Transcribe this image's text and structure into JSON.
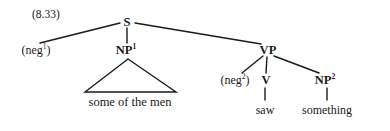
{
  "figure": {
    "example_number": "(8.33)",
    "type": "phrase-structure-tree",
    "ink_color": "#1a1a1a",
    "background_color": "#ffffff"
  },
  "nodes": {
    "s": {
      "label": "S",
      "x": 127,
      "y": 22
    },
    "neg1": {
      "label": "(neg",
      "sup": "1",
      "close": ")",
      "x": 36,
      "y": 50
    },
    "np1": {
      "label": "NP",
      "sup": "1",
      "x": 126,
      "y": 50
    },
    "vp": {
      "label": "VP",
      "x": 268,
      "y": 50
    },
    "neg2": {
      "label": "(neg",
      "sup": "2",
      "close": ")",
      "x": 235,
      "y": 80
    },
    "v": {
      "label": "V",
      "x": 266,
      "y": 80
    },
    "np2": {
      "label": "NP",
      "sup": "2",
      "x": 325,
      "y": 80
    }
  },
  "terminals": {
    "phrase_np1": {
      "text": "some of the men",
      "x": 130,
      "y": 102
    },
    "saw": {
      "text": "saw",
      "x": 265,
      "y": 110
    },
    "something": {
      "text": "something",
      "x": 327,
      "y": 110
    }
  },
  "edges": [
    {
      "name": "s-to-neg1",
      "from": "S",
      "to": "(neg1)",
      "x1": 120,
      "y1": 23,
      "x2": 40,
      "y2": 43
    },
    {
      "name": "s-to-np1",
      "from": "S",
      "to": "NP1",
      "x1": 127,
      "y1": 28,
      "x2": 127,
      "y2": 43
    },
    {
      "name": "s-to-vp",
      "from": "S",
      "to": "VP",
      "x1": 135,
      "y1": 23,
      "x2": 261,
      "y2": 44
    },
    {
      "name": "vp-to-neg2",
      "from": "VP",
      "to": "(neg2)",
      "x1": 263,
      "y1": 56,
      "x2": 242,
      "y2": 73
    },
    {
      "name": "vp-to-v",
      "from": "VP",
      "to": "V",
      "x1": 267,
      "y1": 57,
      "x2": 266,
      "y2": 73
    },
    {
      "name": "vp-to-np2",
      "from": "VP",
      "to": "NP2",
      "x1": 274,
      "y1": 56,
      "x2": 319,
      "y2": 73
    },
    {
      "name": "v-to-saw",
      "from": "V",
      "to": "saw",
      "x1": 265,
      "y1": 88,
      "x2": 265,
      "y2": 100
    },
    {
      "name": "np2-to-something",
      "from": "NP2",
      "to": "something",
      "x1": 327,
      "y1": 88,
      "x2": 327,
      "y2": 100
    }
  ],
  "triangle": {
    "name": "np1-abbreviation-triangle",
    "apex_x": 128,
    "apex_y": 59,
    "left_x": 85,
    "left_y": 92,
    "right_x": 176,
    "right_y": 92
  }
}
